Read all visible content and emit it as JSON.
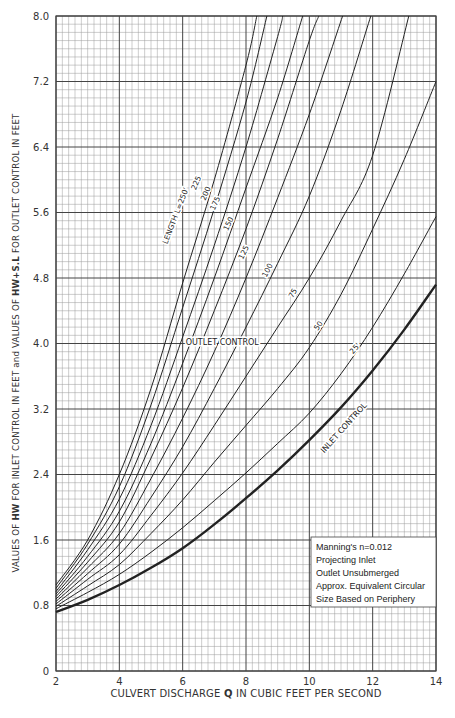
{
  "chart_data": {
    "type": "line",
    "title": "",
    "xlabel": {
      "prefix": "CULVERT DISCHARGE ",
      "bold": "Q",
      "suffix": " IN CUBIC FEET PER SECOND"
    },
    "ylabel": {
      "parts": [
        {
          "text": "VALUES OF ",
          "bold": false
        },
        {
          "text": "HW",
          "bold": true
        },
        {
          "text": " FOR INLET CONTROL IN FEET ",
          "bold": false
        },
        {
          "text": "and",
          "bold": false
        },
        {
          "text": " VALUES OF ",
          "bold": false
        },
        {
          "text": "HW+S.L",
          "bold": true
        },
        {
          "text": " FOR OUTLET CONTROL IN FEET",
          "bold": false
        }
      ]
    },
    "xlim": [
      2,
      14
    ],
    "ylim": [
      0,
      8.0
    ],
    "xticks": [
      2,
      4,
      6,
      8,
      10,
      12,
      14
    ],
    "yticks": [
      0,
      0.8,
      1.6,
      2.4,
      3.2,
      4.0,
      4.8,
      5.6,
      6.4,
      7.2,
      8.0
    ],
    "ytick_labels": [
      "0",
      "0.8",
      "1.6",
      "2.4",
      "3.2",
      "4.0",
      "4.8",
      "5.6",
      "6.4",
      "7.2",
      "8.0"
    ],
    "grid": {
      "on": true,
      "x_minor_step": 0.2,
      "y_minor_step": 0.1,
      "x_major_step": 2,
      "y_major_step": 0.8
    },
    "series": [
      {
        "name": "L=250'",
        "label": "LENGTH L=250'",
        "style": "thin",
        "points": [
          [
            2,
            1.05
          ],
          [
            3,
            1.6
          ],
          [
            4,
            2.4
          ],
          [
            5,
            3.45
          ],
          [
            6,
            4.74
          ],
          [
            7,
            6.0
          ],
          [
            8,
            7.4
          ],
          [
            8.34,
            8.0
          ]
        ]
      },
      {
        "name": "225'",
        "label": "225",
        "style": "thin",
        "points": [
          [
            2,
            1.01
          ],
          [
            3,
            1.55
          ],
          [
            4,
            2.25
          ],
          [
            5,
            3.25
          ],
          [
            6,
            4.44
          ],
          [
            7,
            5.65
          ],
          [
            8,
            6.95
          ],
          [
            8.66,
            8.0
          ]
        ]
      },
      {
        "name": "200'",
        "label": "200",
        "style": "thin",
        "points": [
          [
            2,
            0.97
          ],
          [
            3,
            1.48
          ],
          [
            4,
            2.1
          ],
          [
            5,
            3.0
          ],
          [
            6,
            4.08
          ],
          [
            7,
            5.2
          ],
          [
            8,
            6.4
          ],
          [
            9,
            7.75
          ],
          [
            9.16,
            8.0
          ]
        ]
      },
      {
        "name": "175'",
        "label": "175",
        "style": "thin",
        "points": [
          [
            2,
            0.94
          ],
          [
            3,
            1.4
          ],
          [
            4,
            1.95
          ],
          [
            5,
            2.78
          ],
          [
            6,
            3.76
          ],
          [
            7,
            4.8
          ],
          [
            8,
            5.9
          ],
          [
            9,
            7.0
          ],
          [
            9.79,
            8.0
          ]
        ]
      },
      {
        "name": "150'",
        "label": "150",
        "style": "thin",
        "points": [
          [
            2,
            0.91
          ],
          [
            3,
            1.33
          ],
          [
            4,
            1.82
          ],
          [
            5,
            2.6
          ],
          [
            6,
            3.46
          ],
          [
            7,
            4.4
          ],
          [
            8,
            5.4
          ],
          [
            9,
            6.5
          ],
          [
            10,
            7.7
          ],
          [
            10.3,
            8.0
          ]
        ]
      },
      {
        "name": "125'",
        "label": "125",
        "style": "thin",
        "points": [
          [
            2,
            0.88
          ],
          [
            3,
            1.26
          ],
          [
            4,
            1.68
          ],
          [
            5,
            2.35
          ],
          [
            6,
            3.09
          ],
          [
            7,
            3.9
          ],
          [
            8,
            4.8
          ],
          [
            9,
            5.78
          ],
          [
            10,
            6.8
          ],
          [
            11.05,
            8.0
          ]
        ]
      },
      {
        "name": "100'",
        "label": "100",
        "style": "thin",
        "points": [
          [
            2,
            0.85
          ],
          [
            3,
            1.19
          ],
          [
            4,
            1.55
          ],
          [
            5,
            2.12
          ],
          [
            6,
            2.74
          ],
          [
            7,
            3.45
          ],
          [
            8,
            4.2
          ],
          [
            9,
            4.98
          ],
          [
            10,
            5.8
          ],
          [
            11,
            6.85
          ],
          [
            11.94,
            8.0
          ]
        ]
      },
      {
        "name": "75'",
        "label": "75",
        "style": "thin",
        "points": [
          [
            2,
            0.82
          ],
          [
            3,
            1.12
          ],
          [
            4,
            1.42
          ],
          [
            5,
            1.9
          ],
          [
            6,
            2.42
          ],
          [
            7,
            3.0
          ],
          [
            8,
            3.6
          ],
          [
            9,
            4.2
          ],
          [
            10,
            4.8
          ],
          [
            11,
            5.5
          ],
          [
            12,
            6.3
          ],
          [
            13.14,
            8.0
          ]
        ]
      },
      {
        "name": "50'",
        "label": "50",
        "style": "thin",
        "points": [
          [
            2,
            0.79
          ],
          [
            3,
            1.04
          ],
          [
            4,
            1.3
          ],
          [
            5,
            1.68
          ],
          [
            6,
            2.09
          ],
          [
            7,
            2.55
          ],
          [
            8,
            3.0
          ],
          [
            9,
            3.45
          ],
          [
            10,
            3.95
          ],
          [
            11,
            4.6
          ],
          [
            12,
            5.4
          ],
          [
            13,
            6.25
          ],
          [
            14,
            7.2
          ]
        ]
      },
      {
        "name": "25'",
        "label": "25'",
        "style": "thin",
        "points": [
          [
            2,
            0.76
          ],
          [
            3,
            0.96
          ],
          [
            4,
            1.18
          ],
          [
            5,
            1.45
          ],
          [
            6,
            1.75
          ],
          [
            7,
            2.08
          ],
          [
            8,
            2.42
          ],
          [
            9,
            2.78
          ],
          [
            10,
            3.15
          ],
          [
            11,
            3.63
          ],
          [
            12,
            4.2
          ],
          [
            13,
            4.85
          ],
          [
            14,
            5.55
          ]
        ]
      },
      {
        "name": "Inlet control",
        "label": "INLET CONTROL",
        "style": "bold",
        "points": [
          [
            2,
            0.72
          ],
          [
            3,
            0.87
          ],
          [
            4,
            1.05
          ],
          [
            5,
            1.26
          ],
          [
            6,
            1.5
          ],
          [
            7,
            1.79
          ],
          [
            8,
            2.11
          ],
          [
            9,
            2.45
          ],
          [
            10,
            2.82
          ],
          [
            11,
            3.22
          ],
          [
            12,
            3.67
          ],
          [
            13,
            4.17
          ],
          [
            14,
            4.72
          ]
        ]
      }
    ],
    "annotations": [
      {
        "text": "LENGTH L=250'",
        "x": 5.85,
        "y": 5.55,
        "rotate": -69
      },
      {
        "text": "225",
        "x": 6.5,
        "y": 5.95,
        "rotate": -68
      },
      {
        "text": "200",
        "x": 6.8,
        "y": 5.82,
        "rotate": -67
      },
      {
        "text": "175",
        "x": 7.1,
        "y": 5.7,
        "rotate": -66
      },
      {
        "text": "150",
        "x": 7.52,
        "y": 5.45,
        "rotate": -65
      },
      {
        "text": "125",
        "x": 8.0,
        "y": 5.1,
        "rotate": -64
      },
      {
        "text": "100",
        "x": 8.75,
        "y": 4.88,
        "rotate": -62
      },
      {
        "text": "75",
        "x": 9.55,
        "y": 4.6,
        "rotate": -60
      },
      {
        "text": "50",
        "x": 10.35,
        "y": 4.2,
        "rotate": -56
      },
      {
        "text": "25'",
        "x": 11.5,
        "y": 3.92,
        "rotate": -50
      },
      {
        "text": "OUTLET CONTROL",
        "x": 7.25,
        "y": 3.98,
        "rotate": 0
      },
      {
        "text": "INLET CONTROL",
        "x": 11.15,
        "y": 2.95,
        "rotate": -48
      }
    ],
    "legend_box": {
      "lines": [
        "Manning's n=0.012",
        "Projecting Inlet",
        "Outlet Unsubmerged",
        "Approx. Equivalent Circular",
        "Size Based on Periphery"
      ],
      "position": "lower-right"
    }
  },
  "colors": {
    "grid_minor": "#9a9a9a",
    "grid_major": "#444444",
    "curve": "#222222",
    "background": "#ffffff"
  }
}
